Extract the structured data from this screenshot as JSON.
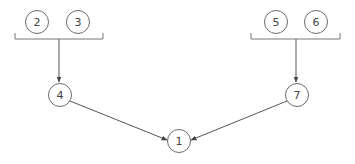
{
  "diagram": {
    "type": "tree",
    "colors": {
      "stroke": "#6a6a6a",
      "text": "#444444",
      "background": "#ffffff"
    },
    "nodes": [
      {
        "id": "n2",
        "label": "2",
        "cx": 37,
        "cy": 22
      },
      {
        "id": "n3",
        "label": "3",
        "cx": 78,
        "cy": 22
      },
      {
        "id": "n5",
        "label": "5",
        "cx": 276,
        "cy": 22
      },
      {
        "id": "n6",
        "label": "6",
        "cx": 316,
        "cy": 22
      },
      {
        "id": "n4",
        "label": "4",
        "cx": 60,
        "cy": 95
      },
      {
        "id": "n7",
        "label": "7",
        "cx": 297,
        "cy": 95
      },
      {
        "id": "n1",
        "label": "1",
        "cx": 179,
        "cy": 141
      }
    ],
    "groups": [
      {
        "id": "group-left",
        "members": [
          "2",
          "3"
        ],
        "target": "4"
      },
      {
        "id": "group-right",
        "members": [
          "5",
          "6"
        ],
        "target": "7"
      }
    ],
    "edges": [
      {
        "from": "group(2,3)",
        "to": "4"
      },
      {
        "from": "group(5,6)",
        "to": "7"
      },
      {
        "from": "4",
        "to": "1"
      },
      {
        "from": "7",
        "to": "1"
      }
    ]
  }
}
